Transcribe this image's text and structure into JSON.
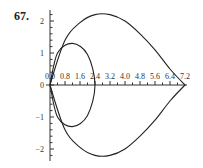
{
  "problem": {
    "number": "67."
  },
  "chart_data": {
    "type": "line",
    "title": "",
    "xlabel": "",
    "ylabel": "",
    "x_ticks": [
      "0.0",
      "0.8",
      "1.6",
      "2.4",
      "3.2",
      "4.0",
      "4.8",
      "5.6",
      "6.4",
      "7.2"
    ],
    "y_ticks": [
      "-2",
      "-1",
      "0",
      "1",
      "2"
    ],
    "xlim": [
      0,
      7.2
    ],
    "ylim": [
      -2.3,
      2.3
    ],
    "grid": false,
    "series": [
      {
        "name": "outer curve",
        "points": [
          [
            0,
            0
          ],
          [
            0.8,
            1.4
          ],
          [
            1.6,
            1.95
          ],
          [
            2.4,
            2.2
          ],
          [
            3.2,
            2.2
          ],
          [
            4.0,
            2.0
          ],
          [
            4.8,
            1.6
          ],
          [
            5.6,
            1.1
          ],
          [
            6.4,
            0.5
          ],
          [
            7.2,
            0
          ],
          [
            6.4,
            -0.5
          ],
          [
            5.6,
            -1.1
          ],
          [
            4.8,
            -1.6
          ],
          [
            4.0,
            -2.0
          ],
          [
            3.2,
            -2.2
          ],
          [
            2.4,
            -2.2
          ],
          [
            1.6,
            -1.95
          ],
          [
            0.8,
            -1.4
          ],
          [
            0,
            0
          ]
        ]
      },
      {
        "name": "inner loop",
        "points": [
          [
            0,
            0
          ],
          [
            0.4,
            1.0
          ],
          [
            1.2,
            1.3
          ],
          [
            2.0,
            0.95
          ],
          [
            2.4,
            0
          ],
          [
            2.0,
            -0.95
          ],
          [
            1.2,
            -1.3
          ],
          [
            0.4,
            -1.0
          ],
          [
            0,
            0
          ]
        ]
      }
    ]
  }
}
